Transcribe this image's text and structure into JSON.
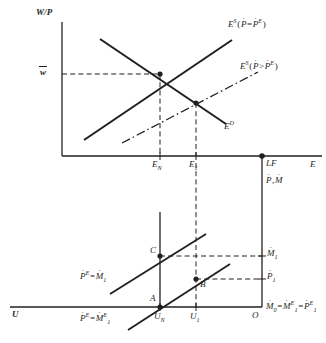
{
  "figure": {
    "type": "economics-diagram",
    "stroke_color": "#231f20",
    "background": "#ffffff"
  },
  "upper_panel": {
    "y_axis_label": "W/P",
    "x_axis_label": "E",
    "y_tick_label": "w̄",
    "x_tick_labels": [
      "E_N",
      "E_1",
      "LF"
    ],
    "curves": [
      {
        "name": "labour-supply-expected",
        "label_parts": {
          "base": "E",
          "sup": "S",
          "inner_left": "P",
          "operator": "=",
          "inner_right": "P",
          "inner_right_sup": "E"
        },
        "label_text": "E^S(Ṗ = Ṗ^E)",
        "style": "solid",
        "slope": "upward"
      },
      {
        "name": "labour-supply-surprise",
        "label_parts": {
          "base": "E",
          "sup": "S",
          "inner_left": "P",
          "operator": ">",
          "inner_right": "P",
          "inner_right_sup": "E"
        },
        "label_text": "E^S(Ṗ > Ṗ^E)",
        "style": "dash-dot",
        "slope": "upward"
      },
      {
        "name": "labour-demand",
        "label_parts": {
          "base": "E",
          "sup": "D"
        },
        "label_text": "E^D",
        "style": "solid",
        "slope": "downward"
      }
    ],
    "equilibria": [
      {
        "name": "natural-equilibrium",
        "x_label": "E_N",
        "y_label": "w̄"
      },
      {
        "name": "short-run-equilibrium",
        "x_label": "E_1"
      }
    ]
  },
  "divider_axis": {
    "right_vertical_axis_label": "Ṗ, Ṁ",
    "full_employment_marker": "LF"
  },
  "lower_panel": {
    "x_axis_label": "U",
    "origin_label": "O",
    "x_tick_labels": [
      "U_N",
      "U_1"
    ],
    "y_tick_labels": [
      "Ṁ1",
      "Ṗ1"
    ],
    "baseline_label": "Ṁ0 = Ṁ^E_1 = Ṗ^E_1",
    "curves": [
      {
        "name": "phillips-curve-upper",
        "label_text": "Ṗ^E = Ṁ1",
        "style": "solid"
      },
      {
        "name": "phillips-curve-lower",
        "label_text": "Ṗ^E = Ṁ^E_1",
        "style": "solid"
      }
    ],
    "points": [
      {
        "name": "point-C",
        "label": "C"
      },
      {
        "name": "point-A",
        "label": "A"
      },
      {
        "name": "point-B",
        "label": "B"
      }
    ]
  },
  "glyphs": {
    "dot_accent": "˙",
    "bar_accent": "¯"
  }
}
